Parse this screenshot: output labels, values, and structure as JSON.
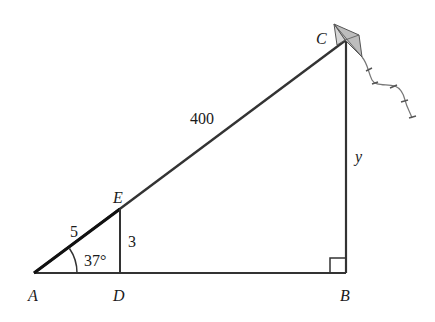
{
  "figure": {
    "type": "right-triangle kite diagram",
    "points": {
      "A": {
        "label": "A"
      },
      "B": {
        "label": "B"
      },
      "C": {
        "label": "C"
      },
      "D": {
        "label": "D"
      },
      "E": {
        "label": "E"
      }
    },
    "measurements": {
      "AC": "400",
      "AE": "5",
      "ED": "3",
      "BC": "y",
      "angle_A": "37°"
    },
    "colors": {
      "line": "#333333",
      "kite_fill": "#bdbdbd",
      "background": "#ffffff"
    }
  }
}
